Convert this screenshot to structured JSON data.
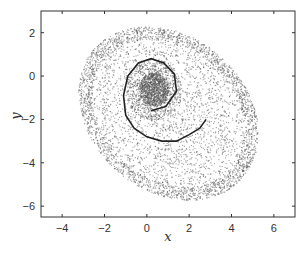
{
  "chart_data": {
    "type": "scatter",
    "title": "",
    "xlabel": "x",
    "ylabel": "y",
    "xlim": [
      -5,
      7
    ],
    "ylim": [
      -6.5,
      3
    ],
    "xticks": [
      -4,
      -2,
      0,
      2,
      4,
      6
    ],
    "yticks": [
      2,
      0,
      -2,
      -4,
      -6
    ],
    "grid": false,
    "legend": null,
    "series": [
      {
        "name": "point cloud",
        "kind": "scatter",
        "color": "#555555",
        "description": "Dense cloud of ~thousands of points forming a tilted egg-shaped region centered near (1, -1.5), extending x from about -3.2 to 5.6 and y from about -5.9 to 2.4; densest core near (0.3, -0.5).",
        "outer_boundary_center": [
          1.0,
          -1.7
        ],
        "outer_semi_axes": [
          4.6,
          3.6
        ],
        "outer_rotation_deg": -38,
        "core_center": [
          0.3,
          -0.6
        ],
        "core_radius": 1.0
      },
      {
        "name": "trajectory",
        "kind": "line",
        "color": "#222222",
        "x": [
          0.2,
          0.9,
          1.4,
          1.3,
          0.8,
          0.2,
          -0.4,
          -0.9,
          -1.1,
          -1.0,
          -0.6,
          0.0,
          0.7,
          1.4,
          2.0,
          2.5,
          2.8
        ],
        "y": [
          -1.6,
          -1.4,
          -0.7,
          0.1,
          0.6,
          0.8,
          0.6,
          0.0,
          -0.9,
          -1.8,
          -2.4,
          -2.8,
          -3.0,
          -3.0,
          -2.7,
          -2.4,
          -2.0
        ]
      }
    ]
  }
}
